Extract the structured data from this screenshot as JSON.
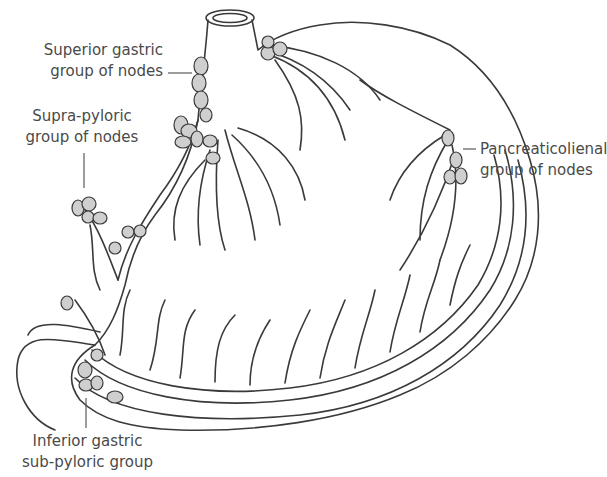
{
  "colors": {
    "outline": "#3a3a3a",
    "vessel_fill": "#c8c8c8",
    "node_fill": "#cfcfcf",
    "label_text": "#4a4a4a",
    "leader_line": "#5a5a5a",
    "background": "#ffffff"
  },
  "labels": {
    "superior_gastric": {
      "line1": "Superior gastric",
      "line2": "group of nodes"
    },
    "supra_pyloric": {
      "line1": "Supra-pyloric",
      "line2": "group of nodes"
    },
    "pancreaticolienal": {
      "line1": "Pancreaticolienal",
      "line2": "group of nodes"
    },
    "inferior_gastric": {
      "line1": "Inferior gastric",
      "line2": "sub-pyloric group"
    }
  }
}
